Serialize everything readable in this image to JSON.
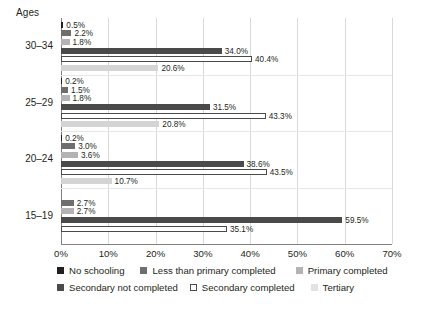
{
  "chart_data": {
    "type": "bar",
    "orientation": "horizontal",
    "title": "",
    "xlabel": "",
    "ylabel": "Ages",
    "xlim": [
      0,
      70
    ],
    "grid": true,
    "legend_position": "bottom",
    "xticks": [
      "0%",
      "10%",
      "20%",
      "30%",
      "40%",
      "50%",
      "60%",
      "70%"
    ],
    "xtick_values": [
      0,
      10,
      20,
      30,
      40,
      50,
      60,
      70
    ],
    "categories": [
      "30–34",
      "25–29",
      "20–24",
      "15–19"
    ],
    "series": [
      {
        "name": "No schooling",
        "color": "#231f20",
        "values": [
          0.5,
          0.2,
          0.2,
          0.0
        ],
        "labels": [
          "0.5%",
          "0.2%",
          "0.2%",
          ""
        ]
      },
      {
        "name": "Less than primary completed",
        "color": "#6e6e6e",
        "values": [
          2.2,
          1.5,
          3.0,
          2.7
        ],
        "labels": [
          "2.2%",
          "1.5%",
          "3.0%",
          "2.7%"
        ]
      },
      {
        "name": "Primary completed",
        "color": "#b3b3b3",
        "values": [
          1.8,
          1.8,
          3.6,
          2.7
        ],
        "labels": [
          "1.8%",
          "1.8%",
          "3.6%",
          "2.7%"
        ]
      },
      {
        "name": "Secondary not completed",
        "color": "#4a4a4a",
        "values": [
          34.0,
          31.5,
          38.6,
          59.5
        ],
        "labels": [
          "34.0%",
          "31.5%",
          "38.6%",
          "59.5%"
        ]
      },
      {
        "name": "Secondary completed",
        "color": "#ffffff",
        "border": "#4a4a4a",
        "values": [
          40.4,
          43.3,
          43.5,
          35.1
        ],
        "labels": [
          "40.4%",
          "43.3%",
          "43.5%",
          "35.1%"
        ]
      },
      {
        "name": "Tertiary",
        "color": "#d4d4d4",
        "values": [
          20.6,
          20.8,
          10.7,
          0.0
        ],
        "labels": [
          "20.6%",
          "20.8%",
          "10.7%",
          ""
        ]
      }
    ]
  },
  "legend": {
    "row1": [
      {
        "label": "No schooling",
        "color": "#231f20",
        "border": "#231f20"
      },
      {
        "label": "Less than primary completed",
        "color": "#6e6e6e",
        "border": "#6e6e6e"
      },
      {
        "label": "Primary completed",
        "color": "#b3b3b3",
        "border": "#b3b3b3"
      }
    ],
    "row2": [
      {
        "label": "Secondary not completed",
        "color": "#4a4a4a",
        "border": "#4a4a4a"
      },
      {
        "label": "Secondary completed",
        "color": "#ffffff",
        "border": "#4a4a4a"
      },
      {
        "label": "Tertiary",
        "color": "#e2e2e2",
        "border": "#e2e2e2"
      }
    ]
  }
}
